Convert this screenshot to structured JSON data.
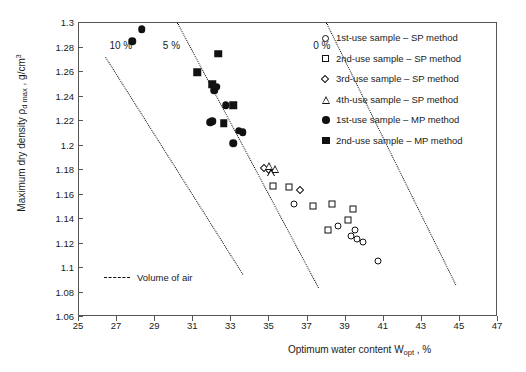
{
  "chart_data": {
    "type": "scatter",
    "title": "",
    "xlabel": "Optimum water content Wopt , %",
    "ylabel": "Maximum dry density ρd max , g/cm3",
    "xlim": [
      25,
      47
    ],
    "ylim": [
      1.06,
      1.3
    ],
    "xticks": [
      25,
      27,
      29,
      31,
      33,
      35,
      37,
      39,
      41,
      43,
      45,
      47
    ],
    "yticks": [
      1.06,
      1.08,
      1.1,
      1.12,
      1.14,
      1.16,
      1.18,
      1.2,
      1.22,
      1.24,
      1.26,
      1.28,
      1.3
    ],
    "grid": false,
    "legend_position": "upper-right",
    "series": [
      {
        "name": "1st-use sample – SP method",
        "marker": "circle-open",
        "points": [
          {
            "x": 36.3,
            "y": 1.152
          },
          {
            "x": 38.6,
            "y": 1.134
          },
          {
            "x": 39.5,
            "y": 1.131
          },
          {
            "x": 39.3,
            "y": 1.126
          },
          {
            "x": 39.6,
            "y": 1.124
          },
          {
            "x": 39.9,
            "y": 1.121
          },
          {
            "x": 40.7,
            "y": 1.106
          }
        ]
      },
      {
        "name": "2nd-use sample – SP method",
        "marker": "square-open",
        "points": [
          {
            "x": 35.2,
            "y": 1.167
          },
          {
            "x": 36.0,
            "y": 1.166
          },
          {
            "x": 37.3,
            "y": 1.151
          },
          {
            "x": 38.3,
            "y": 1.152
          },
          {
            "x": 39.4,
            "y": 1.148
          },
          {
            "x": 39.1,
            "y": 1.139
          },
          {
            "x": 38.1,
            "y": 1.131
          }
        ]
      },
      {
        "name": "3rd-use sample – SP method",
        "marker": "diamond-open",
        "points": [
          {
            "x": 34.7,
            "y": 1.182
          },
          {
            "x": 35.0,
            "y": 1.18
          },
          {
            "x": 36.6,
            "y": 1.164
          }
        ]
      },
      {
        "name": "4th-use sample – SP method",
        "marker": "triangle-open",
        "points": [
          {
            "x": 35.0,
            "y": 1.183
          },
          {
            "x": 35.3,
            "y": 1.181
          },
          {
            "x": 35.1,
            "y": 1.178
          }
        ]
      },
      {
        "name": "1st-use sample – MP method",
        "marker": "circle-fill",
        "points": [
          {
            "x": 28.3,
            "y": 1.295
          },
          {
            "x": 27.8,
            "y": 1.285
          },
          {
            "x": 32.2,
            "y": 1.248
          },
          {
            "x": 32.1,
            "y": 1.245
          },
          {
            "x": 32.0,
            "y": 1.22
          },
          {
            "x": 31.9,
            "y": 1.219
          },
          {
            "x": 32.7,
            "y": 1.233
          },
          {
            "x": 33.4,
            "y": 1.212
          },
          {
            "x": 33.6,
            "y": 1.211
          },
          {
            "x": 33.1,
            "y": 1.202
          }
        ]
      },
      {
        "name": "2nd-use sample – MP method",
        "marker": "square-fill",
        "points": [
          {
            "x": 31.2,
            "y": 1.26
          },
          {
            "x": 32.3,
            "y": 1.275
          },
          {
            "x": 32.0,
            "y": 1.25
          },
          {
            "x": 33.1,
            "y": 1.233
          },
          {
            "x": 32.6,
            "y": 1.218
          }
        ]
      }
    ],
    "air_void_lines": [
      {
        "label": "10 %",
        "label_x": 26.6,
        "label_y": 1.281,
        "x1": 26.4,
        "y1": 1.272,
        "x2": 33.6,
        "y2": 1.095
      },
      {
        "label": "5 %",
        "label_x": 29.4,
        "label_y": 1.281,
        "x1": 30.2,
        "y1": 1.3,
        "x2": 37.6,
        "y2": 1.084
      },
      {
        "label": "0 %",
        "label_x": 37.3,
        "label_y": 1.281,
        "x1": 38.0,
        "y1": 1.3,
        "x2": 44.8,
        "y2": 1.086
      }
    ],
    "annotations": [
      {
        "name": "volume-of-air-note",
        "text": "Volume of air"
      }
    ]
  },
  "axes": {
    "y_title_main": "Maximum dry density",
    "y_title_rho": "ρ",
    "y_title_rho_sub": "d max",
    "y_title_unit": " , g/cm",
    "y_title_unit_sup": "3",
    "x_title_main": "Optimum water content W",
    "x_title_sub": "opt",
    "x_title_tail": " , %"
  },
  "legend": {
    "items": [
      {
        "marker": "circle-open",
        "label": "1st-use sample – SP method"
      },
      {
        "marker": "square-open",
        "label": "2nd-use sample – SP method"
      },
      {
        "marker": "diamond-open",
        "label": "3rd-use sample – SP method"
      },
      {
        "marker": "triangle-open",
        "label": "4th-use sample – SP method"
      },
      {
        "marker": "circle-fill",
        "label": "1st-use sample – MP method"
      },
      {
        "marker": "square-fill",
        "label": "2nd-use sample – MP\nmethod"
      }
    ]
  },
  "volume_of_air": {
    "label": "Volume of air"
  }
}
